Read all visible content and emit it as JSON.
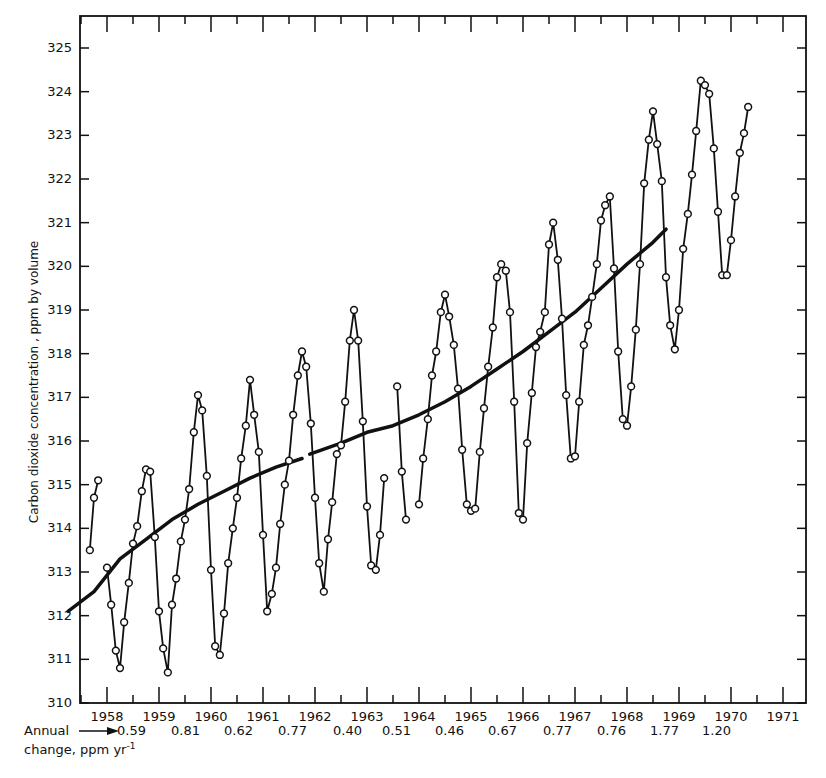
{
  "chart_data": {
    "type": "line",
    "title": "",
    "ylabel": "Carbon dioxide concentration , ppm by volume",
    "xlabel": "",
    "ylim": [
      310,
      325
    ],
    "xlim": [
      1957.6,
      1971.6
    ],
    "y_ticks": [
      310,
      311,
      312,
      313,
      314,
      315,
      316,
      317,
      318,
      319,
      320,
      321,
      322,
      323,
      324,
      325
    ],
    "x_tick_labels": [
      "1958",
      "1959",
      "1960",
      "1961",
      "1962",
      "1963",
      "1964",
      "1965",
      "1966",
      "1967",
      "1968",
      "1969",
      "1970",
      "1971"
    ],
    "grid": false,
    "legend": null,
    "series": [
      {
        "name": "Monthly mean CO2 (Mauna Loa)",
        "marker": "open-circle",
        "segments": [
          [
            [
              1958.17,
              313.5
            ],
            [
              1958.25,
              314.7
            ],
            [
              1958.33,
              315.1
            ]
          ],
          [
            [
              1958.5,
              313.1
            ],
            [
              1958.58,
              312.25
            ],
            [
              1958.67,
              311.2
            ],
            [
              1958.75,
              310.8
            ],
            [
              1958.83,
              311.85
            ],
            [
              1958.92,
              312.75
            ],
            [
              1959.0,
              313.65
            ],
            [
              1959.08,
              314.05
            ],
            [
              1959.17,
              314.85
            ],
            [
              1959.25,
              315.35
            ],
            [
              1959.33,
              315.3
            ],
            [
              1959.42,
              313.8
            ],
            [
              1959.5,
              312.1
            ],
            [
              1959.58,
              311.25
            ],
            [
              1959.67,
              310.7
            ],
            [
              1959.75,
              312.25
            ],
            [
              1959.83,
              312.85
            ],
            [
              1959.92,
              313.7
            ],
            [
              1960.0,
              314.2
            ],
            [
              1960.08,
              314.9
            ],
            [
              1960.17,
              316.2
            ],
            [
              1960.25,
              317.05
            ],
            [
              1960.33,
              316.7
            ],
            [
              1960.42,
              315.2
            ],
            [
              1960.5,
              313.05
            ],
            [
              1960.58,
              311.3
            ],
            [
              1960.67,
              311.1
            ],
            [
              1960.75,
              312.05
            ],
            [
              1960.83,
              313.2
            ],
            [
              1960.92,
              314.0
            ],
            [
              1961.0,
              314.7
            ],
            [
              1961.08,
              315.6
            ],
            [
              1961.17,
              316.35
            ],
            [
              1961.25,
              317.4
            ],
            [
              1961.33,
              316.6
            ],
            [
              1961.42,
              315.75
            ],
            [
              1961.5,
              313.85
            ],
            [
              1961.58,
              312.1
            ],
            [
              1961.67,
              312.5
            ],
            [
              1961.75,
              313.1
            ],
            [
              1961.83,
              314.1
            ],
            [
              1961.92,
              315.0
            ],
            [
              1962.0,
              315.55
            ],
            [
              1962.08,
              316.6
            ],
            [
              1962.17,
              317.5
            ],
            [
              1962.25,
              318.05
            ],
            [
              1962.33,
              317.7
            ],
            [
              1962.42,
              316.4
            ],
            [
              1962.5,
              314.7
            ],
            [
              1962.58,
              313.2
            ],
            [
              1962.67,
              312.55
            ],
            [
              1962.75,
              313.75
            ],
            [
              1962.83,
              314.6
            ],
            [
              1962.92,
              315.7
            ],
            [
              1963.0,
              315.9
            ],
            [
              1963.08,
              316.9
            ],
            [
              1963.17,
              318.3
            ],
            [
              1963.25,
              319.0
            ],
            [
              1963.33,
              318.3
            ],
            [
              1963.42,
              316.45
            ],
            [
              1963.5,
              314.5
            ],
            [
              1963.58,
              313.15
            ],
            [
              1963.67,
              313.05
            ],
            [
              1963.75,
              313.85
            ],
            [
              1963.83,
              315.15
            ]
          ],
          [
            [
              1964.08,
              317.25
            ],
            [
              1964.17,
              315.3
            ],
            [
              1964.25,
              314.2
            ]
          ],
          [
            [
              1964.5,
              314.55
            ],
            [
              1964.58,
              315.6
            ],
            [
              1964.67,
              316.5
            ],
            [
              1964.75,
              317.5
            ],
            [
              1964.83,
              318.05
            ],
            [
              1964.92,
              318.95
            ],
            [
              1965.0,
              319.35
            ],
            [
              1965.08,
              318.85
            ],
            [
              1965.17,
              318.2
            ],
            [
              1965.25,
              317.2
            ],
            [
              1965.33,
              315.8
            ],
            [
              1965.42,
              314.55
            ],
            [
              1965.5,
              314.4
            ],
            [
              1965.58,
              314.45
            ],
            [
              1965.67,
              315.75
            ],
            [
              1965.75,
              316.75
            ],
            [
              1965.83,
              317.7
            ],
            [
              1965.92,
              318.6
            ],
            [
              1966.0,
              319.75
            ],
            [
              1966.08,
              320.05
            ],
            [
              1966.17,
              319.9
            ],
            [
              1966.25,
              318.95
            ],
            [
              1966.33,
              316.9
            ],
            [
              1966.42,
              314.35
            ],
            [
              1966.5,
              314.2
            ],
            [
              1966.58,
              315.95
            ],
            [
              1966.67,
              317.1
            ],
            [
              1966.75,
              318.15
            ],
            [
              1966.83,
              318.5
            ],
            [
              1966.92,
              318.95
            ],
            [
              1967.0,
              320.5
            ],
            [
              1967.08,
              321.0
            ],
            [
              1967.17,
              320.15
            ],
            [
              1967.25,
              318.8
            ],
            [
              1967.33,
              317.05
            ],
            [
              1967.42,
              315.6
            ],
            [
              1967.5,
              315.65
            ],
            [
              1967.58,
              316.9
            ],
            [
              1967.67,
              318.2
            ],
            [
              1967.75,
              318.65
            ],
            [
              1967.83,
              319.3
            ],
            [
              1967.92,
              320.05
            ],
            [
              1968.0,
              321.05
            ],
            [
              1968.08,
              321.4
            ],
            [
              1968.17,
              321.6
            ],
            [
              1968.25,
              319.95
            ],
            [
              1968.33,
              318.05
            ],
            [
              1968.42,
              316.5
            ],
            [
              1968.5,
              316.35
            ],
            [
              1968.58,
              317.25
            ],
            [
              1968.67,
              318.55
            ],
            [
              1968.75,
              320.05
            ],
            [
              1968.83,
              321.9
            ],
            [
              1968.92,
              322.9
            ],
            [
              1969.0,
              323.55
            ],
            [
              1969.08,
              322.8
            ],
            [
              1969.17,
              321.95
            ],
            [
              1969.25,
              319.75
            ],
            [
              1969.33,
              318.65
            ],
            [
              1969.42,
              318.1
            ],
            [
              1969.5,
              319.0
            ],
            [
              1969.58,
              320.4
            ],
            [
              1969.67,
              321.2
            ],
            [
              1969.75,
              322.1
            ],
            [
              1969.83,
              323.1
            ],
            [
              1969.92,
              324.25
            ],
            [
              1970.0,
              324.15
            ],
            [
              1970.08,
              323.95
            ],
            [
              1970.17,
              322.7
            ],
            [
              1970.25,
              321.25
            ],
            [
              1970.33,
              319.8
            ],
            [
              1970.42,
              319.8
            ],
            [
              1970.5,
              320.6
            ],
            [
              1970.58,
              321.6
            ],
            [
              1970.67,
              322.6
            ],
            [
              1970.75,
              323.05
            ],
            [
              1970.83,
              323.65
            ]
          ]
        ]
      },
      {
        "name": "Smoothed trend",
        "marker": "none",
        "segments": [
          [
            [
              1957.75,
              312.1
            ],
            [
              1958.25,
              312.55
            ],
            [
              1958.75,
              313.3
            ],
            [
              1959.25,
              313.75
            ],
            [
              1959.75,
              314.2
            ],
            [
              1960.25,
              314.55
            ],
            [
              1960.75,
              314.85
            ],
            [
              1961.25,
              315.15
            ],
            [
              1961.75,
              315.4
            ],
            [
              1962.25,
              315.6
            ]
          ],
          [
            [
              1962.4,
              315.7
            ],
            [
              1963.0,
              315.95
            ],
            [
              1963.5,
              316.2
            ],
            [
              1964.0,
              316.35
            ],
            [
              1964.5,
              316.6
            ],
            [
              1965.0,
              316.9
            ],
            [
              1965.5,
              317.25
            ],
            [
              1966.0,
              317.65
            ],
            [
              1966.5,
              318.05
            ],
            [
              1967.0,
              318.5
            ],
            [
              1967.5,
              318.95
            ],
            [
              1968.0,
              319.5
            ],
            [
              1968.5,
              320.05
            ],
            [
              1969.0,
              320.55
            ],
            [
              1969.25,
              320.85
            ]
          ]
        ]
      }
    ],
    "annotations": {
      "annual_change_label_line1": "Annual",
      "annual_change_label_line2": "change, ppm yr⁻¹",
      "annual_change_arrow": "→",
      "annual_change_values": [
        {
          "between": "1958",
          "value": "0.59"
        },
        {
          "between": "1959",
          "value": "0.81"
        },
        {
          "between": "1960",
          "value": "0.62"
        },
        {
          "between": "1961",
          "value": "0.77"
        },
        {
          "between": "1962",
          "value": "0.40"
        },
        {
          "between": "1963",
          "value": "0.51"
        },
        {
          "between": "1964",
          "value": "0.46"
        },
        {
          "between": "1965",
          "value": "0.67"
        },
        {
          "between": "1966",
          "value": "0.77"
        },
        {
          "between": "1967",
          "value": "0.76"
        },
        {
          "between": "1968",
          "value": "1.77"
        },
        {
          "between": "1969",
          "value": "1.20"
        }
      ]
    }
  },
  "annual": {
    "line1": "Annual",
    "line2": "change, ppm yr",
    "exp": "-1",
    "values": [
      "0.59",
      "0.81",
      "0.62",
      "0.77",
      "0.40",
      "0.51",
      "0.46",
      "0.67",
      "0.77",
      "0.76",
      "1.77",
      "1.20"
    ]
  }
}
